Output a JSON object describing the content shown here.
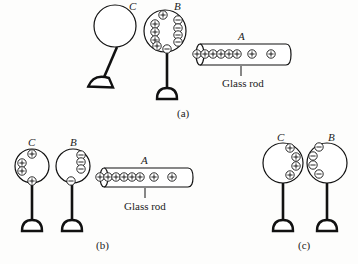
{
  "figure": {
    "panels": [
      {
        "id": "a",
        "caption": "(a)",
        "objects": {
          "sphere_c": {
            "label": "C",
            "charges": []
          },
          "sphere_b": {
            "label": "B",
            "positive_charges": 5,
            "negative_charges": 5,
            "note": "plus on left side (facing away), minus on right side facing rod"
          },
          "rod_a": {
            "label": "A",
            "material_label": "Glass rod",
            "positive_charges": 8
          }
        }
      },
      {
        "id": "b",
        "caption": "(b)",
        "objects": {
          "sphere_c": {
            "label": "C",
            "positive_charges": 4
          },
          "sphere_b": {
            "label": "B",
            "negative_charges": 4
          },
          "rod_a": {
            "label": "A",
            "material_label": "Glass rod",
            "positive_charges": 8
          }
        }
      },
      {
        "id": "c",
        "caption": "(c)",
        "objects": {
          "sphere_c": {
            "label": "C",
            "positive_charges": 4
          },
          "sphere_b": {
            "label": "B",
            "negative_charges": 4
          }
        }
      }
    ]
  },
  "labels": {
    "a_C": "C",
    "a_B": "B",
    "a_A": "A",
    "a_rod": "Glass rod",
    "a_cap": "(a)",
    "b_C": "C",
    "b_B": "B",
    "b_A": "A",
    "b_rod": "Glass rod",
    "b_cap": "(b)",
    "c_C": "C",
    "c_B": "B",
    "c_cap": "(c)"
  },
  "colors": {
    "ink": "#111111",
    "paper": "#fdfdfc"
  }
}
